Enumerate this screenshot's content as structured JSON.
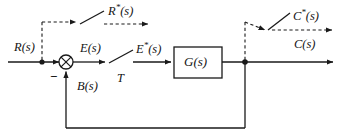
{
  "diagram": {
    "type": "control-block-diagram",
    "background_color": "#ffffff",
    "line_color": "#1a1a1a",
    "labels": {
      "input": "R(s)",
      "input_sampled": "R*(s)",
      "error": "E(s)",
      "error_sampled": "E*(s)",
      "feedback": "B(s)",
      "plant": "G(s)",
      "output": "C(s)",
      "output_sampled": "C*(s)",
      "sample_period": "T",
      "summing_sign_negative": "−"
    },
    "blocks": [
      {
        "name": "plant",
        "label": "G(s)",
        "x": 174,
        "y": 47,
        "width": 48,
        "height": 31
      }
    ],
    "summing_junction": {
      "name": "summing-junction",
      "cx": 66,
      "cy": 62,
      "r": 7,
      "style": "crossed-circle",
      "signs": [
        "+",
        "−"
      ]
    },
    "samplers": [
      {
        "name": "sampler-input",
        "period": "T",
        "x": 108,
        "y": 62,
        "solid": true
      },
      {
        "name": "sampler-output",
        "period": "T",
        "x": 268,
        "y": 33,
        "solid": false
      }
    ],
    "junction_dots": [
      {
        "name": "input-pickoff",
        "cx": 42,
        "cy": 62
      },
      {
        "name": "output-pickoff",
        "cx": 245,
        "cy": 62
      }
    ],
    "signal_flow": [
      "R(s) enters at left along the forward path",
      "R*(s) shown as dashed sampled version branching upward from the input pickoff",
      "Summing junction subtracts B(s) from R(s) to form E(s)",
      "E(s) passes through sampler T to become E*(s)",
      "E*(s) drives plant G(s)",
      "G(s) output is C(s); dashed branch gives sampled output C*(s)",
      "C(s) feeds back as B(s) to the summing junction"
    ]
  }
}
